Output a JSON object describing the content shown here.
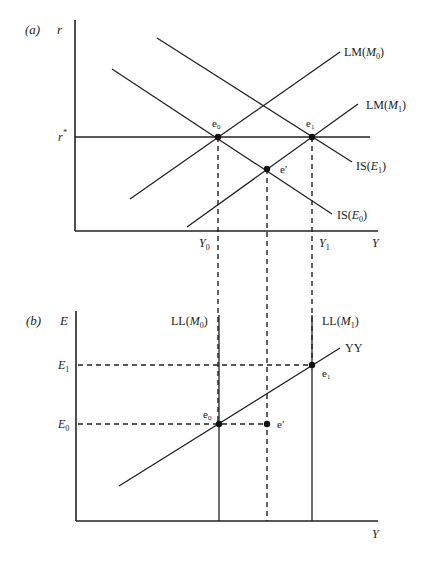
{
  "colors": {
    "ink": "#222222",
    "background": "#ffffff"
  },
  "panel_a": {
    "tag": "(a)",
    "y_axis_label": "r",
    "x_axis_label": "Y",
    "r_star_label": "r",
    "r_star_sup": "*",
    "tick_labels": {
      "y0": {
        "base": "Y",
        "sub": "0"
      },
      "y1": {
        "base": "Y",
        "sub": "1"
      }
    },
    "curves": {
      "lm_m0": {
        "prefix": "LM(",
        "var": "M",
        "sub": "0",
        "suffix": ")"
      },
      "lm_m1": {
        "prefix": "LM(",
        "var": "M",
        "sub": "1",
        "suffix": ")"
      },
      "is_e1": {
        "prefix": "IS(",
        "var": "E",
        "sub": "1",
        "suffix": ")"
      },
      "is_e0": {
        "prefix": "IS(",
        "var": "E",
        "sub": "0",
        "suffix": ")"
      }
    },
    "points": {
      "e0": {
        "base": "e",
        "sub": "0"
      },
      "e1": {
        "base": "e",
        "sub": "1"
      },
      "eprime": {
        "base": "e",
        "sup": "′"
      }
    }
  },
  "panel_b": {
    "tag": "(b)",
    "y_axis_label": "E",
    "x_axis_label": "Y",
    "tick_labels": {
      "e1": {
        "base": "E",
        "sub": "1"
      },
      "e0": {
        "base": "E",
        "sub": "0"
      }
    },
    "curves": {
      "ll_m0": {
        "prefix": "LL(",
        "var": "M",
        "sub": "0",
        "suffix": ")"
      },
      "ll_m1": {
        "prefix": "LL(",
        "var": "M",
        "sub": "1",
        "suffix": ")"
      },
      "yy": {
        "label": "YY"
      }
    },
    "points": {
      "e0": {
        "base": "e",
        "sub": "0"
      },
      "e1": {
        "base": "e",
        "sub": "1"
      },
      "eprime": {
        "base": "e",
        "sup": "′"
      }
    }
  }
}
